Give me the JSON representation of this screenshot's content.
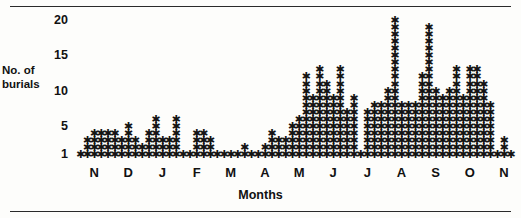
{
  "chart_data": {
    "type": "bar",
    "title": "",
    "subtitle": "",
    "xlabel": "Months",
    "ylabel": "No. of burials",
    "ylabel_lines": [
      "No. of",
      "burials"
    ],
    "ytick_labels": [
      "20",
      "15",
      "10",
      "5",
      "1"
    ],
    "ytick_values": [
      20,
      15,
      10,
      5,
      1
    ],
    "ylim": [
      0,
      21
    ],
    "xtick_labels": [
      "N",
      "D",
      "J",
      "F",
      "M",
      "A",
      "M",
      "J",
      "J",
      "A",
      "S",
      "O",
      "N"
    ],
    "month_names": [
      "November",
      "December",
      "January",
      "February",
      "March",
      "April",
      "May",
      "June",
      "July",
      "August",
      "September",
      "October",
      "November"
    ],
    "grid": false,
    "legend": null,
    "marker": "asterisk",
    "marker_glyph": "✱",
    "note": "Each asterisk represents one burial; columns are successive time intervals across the months.",
    "categories": [
      "N1",
      "N2",
      "N3",
      "N4",
      "N5",
      "D1",
      "D2",
      "D3",
      "D4",
      "D5",
      "J1",
      "J2",
      "J3",
      "J4",
      "J5",
      "F1",
      "F2",
      "F3",
      "F4",
      "F5",
      "M1",
      "M2",
      "M3",
      "M4",
      "M5",
      "A1",
      "A2",
      "A3",
      "A4",
      "A5",
      "Y1",
      "Y2",
      "Y3",
      "Y4",
      "Y5",
      "U1",
      "U2",
      "U3",
      "U4",
      "U5",
      "L1",
      "L2",
      "L3",
      "L4",
      "L5",
      "G1",
      "G2",
      "G3",
      "G4",
      "G5",
      "S1",
      "S2",
      "S3",
      "S4",
      "S5",
      "O1",
      "O2",
      "O3",
      "O4",
      "O5",
      "V1",
      "V2",
      "V3",
      "V4"
    ],
    "values": [
      1,
      3,
      4,
      4,
      4,
      4,
      3,
      5,
      3,
      2,
      4,
      6,
      3,
      3,
      6,
      1,
      1,
      4,
      4,
      3,
      1,
      1,
      1,
      1,
      2,
      1,
      1,
      2,
      4,
      3,
      3,
      5,
      6,
      12,
      9,
      13,
      11,
      9,
      13,
      7,
      9,
      1,
      7,
      8,
      8,
      10,
      20,
      8,
      8,
      8,
      12,
      19,
      10,
      9,
      10,
      13,
      9,
      13,
      13,
      11,
      8,
      1,
      3,
      1
    ],
    "series": [
      {
        "name": "No. of burials",
        "values": [
          1,
          3,
          4,
          4,
          4,
          4,
          3,
          5,
          3,
          2,
          4,
          6,
          3,
          3,
          6,
          1,
          1,
          4,
          4,
          3,
          1,
          1,
          1,
          1,
          2,
          1,
          1,
          2,
          4,
          3,
          3,
          5,
          6,
          12,
          9,
          13,
          11,
          9,
          13,
          7,
          9,
          1,
          7,
          8,
          8,
          10,
          20,
          8,
          8,
          8,
          12,
          19,
          10,
          9,
          10,
          13,
          9,
          13,
          13,
          11,
          8,
          1,
          3,
          1
        ]
      }
    ]
  },
  "axis": {
    "y_title_line1": "No. of",
    "y_title_line2": "burials",
    "x_title": "Months"
  }
}
